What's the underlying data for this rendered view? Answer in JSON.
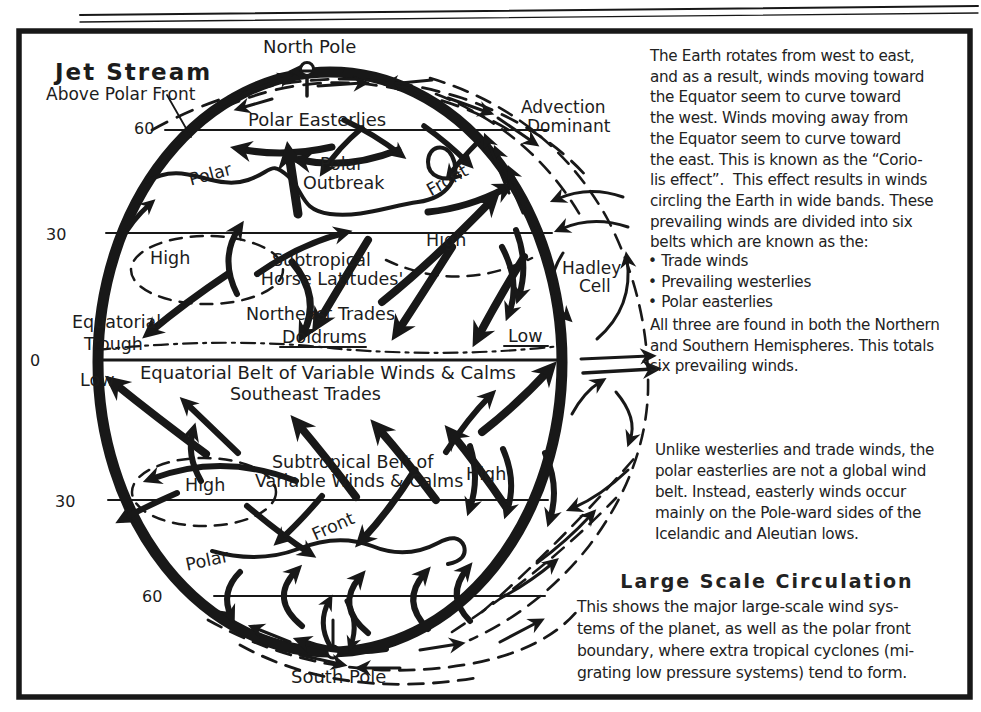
{
  "colors": {
    "ink": "#181818",
    "paper": "#ffffff"
  },
  "diagram": {
    "latitudes": {
      "n60": "60",
      "n30": "30",
      "eq": "0",
      "s30": "30",
      "s60": "60"
    },
    "labels": {
      "north_pole": "North Pole",
      "south_pole": "South Pole",
      "jet_stream_title": "Jet Stream",
      "jet_stream_sub": "Above Polar Front",
      "polar_easterlies": "Polar Easterlies",
      "polar_north": "Polar",
      "polar_outbreak_line1": "Polar",
      "polar_outbreak_line2": "Outbreak",
      "front_north": "Front",
      "advection_line1": "Advection",
      "advection_line2": "Dominant",
      "high_nw": "High",
      "high_ne": "High",
      "subtropical_line1": "Subtropical",
      "subtropical_line2": "'Horse Latitudes'",
      "hadley_line1": "Hadley",
      "hadley_line2": "Cell",
      "equatorial_trough_line1": "Equatorial",
      "equatorial_trough_line2": "Trough",
      "northeast_trades": "Northeast Trades",
      "doldrums": "Doldrums",
      "low_east": "Low",
      "low_west": "Low",
      "equatorial_belt": "Equatorial Belt of Variable Winds & Calms",
      "southeast_trades": "Southeast Trades",
      "subtropical_belt_line1": "Subtropical Belt of",
      "subtropical_belt_line2": "Variable Winds & Calms",
      "high_sw": "High",
      "high_se": "High",
      "front_south": "Front",
      "polar_south": "Polar"
    }
  },
  "sidebar": {
    "para1": "The Earth rotates from west to east,\nand as a result, winds moving toward\nthe Equator seem to curve toward\nthe west. Winds moving away from\nthe Equator seem to curve toward\nthe east. This is known as the “Corio-\nlis effect”.  This effect results in winds\ncircling the Earth in wide bands. These\nprevailing winds are divided into six\nbelts which are known as the:",
    "bullets": [
      "• Trade winds",
      "• Prevailing westerlies",
      "• Polar easterlies"
    ],
    "para1_end": "All three are found in both the Northern\nand Southern Hemispheres. This totals\nsix prevailing winds.",
    "para2": "Unlike westerlies and trade winds, the\npolar easterlies are not a global wind\nbelt. Instead, easterly winds occur\nmainly on the Pole-ward sides of the\nIcelandic and Aleutian lows.",
    "heading": "Large Scale Circulation",
    "para3": "This shows the major large-scale wind sys-\ntems of the planet, as well as the polar front\nboundary, where extra tropical cyclones (mi-\ngrating low pressure systems) tend to form."
  }
}
